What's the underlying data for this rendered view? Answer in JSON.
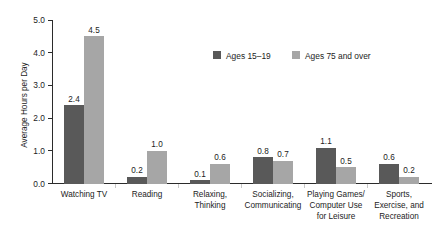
{
  "chart_data": {
    "type": "bar",
    "title": "",
    "subtitle": "",
    "xlabel": "",
    "ylabel": "Average Hours per Day",
    "ylim": [
      0.0,
      5.0
    ],
    "ytick_labels": [
      "0.0",
      "1.0",
      "2.0",
      "3.0",
      "4.0",
      "5.0"
    ],
    "ytick_values": [
      0.0,
      1.0,
      2.0,
      3.0,
      4.0,
      5.0
    ],
    "grid": false,
    "legend_position": "top-center-right",
    "categories": [
      "Watching TV",
      "Reading",
      "Relaxing,\nThinking",
      "Socializing,\nCommunicating",
      "Playing Games/\nComputer Use\nfor Leisure",
      "Sports,\nExercise, and\nRecreation"
    ],
    "category_lines": [
      [
        "Watching TV"
      ],
      [
        "Reading"
      ],
      [
        "Relaxing,",
        "Thinking"
      ],
      [
        "Socializing,",
        "Communicating"
      ],
      [
        "Playing Games/",
        "Computer Use",
        "for Leisure"
      ],
      [
        "Sports,",
        "Exercise, and",
        "Recreation"
      ]
    ],
    "series": [
      {
        "name": "Ages 15–19",
        "color": "#595959",
        "values": [
          2.4,
          0.2,
          0.1,
          0.8,
          1.1,
          0.6
        ],
        "value_labels": [
          "2.4",
          "0.2",
          "0.1",
          "0.8",
          "1.1",
          "0.6"
        ]
      },
      {
        "name": "Ages 75 and over",
        "color": "#a6a6a6",
        "values": [
          4.5,
          1.0,
          0.6,
          0.7,
          0.5,
          0.2
        ],
        "value_labels": [
          "4.5",
          "1.0",
          "0.6",
          "0.7",
          "0.5",
          "0.2"
        ]
      }
    ]
  },
  "legend": {
    "items": [
      {
        "label": "Ages 15–19",
        "color": "#595959"
      },
      {
        "label": "Ages 75 and over",
        "color": "#a6a6a6"
      }
    ]
  },
  "colors": {
    "series_dark": "#595959",
    "series_light": "#a6a6a6",
    "axis": "#2b2b2b",
    "text": "#1c1c1c",
    "background": "#ffffff",
    "separator": "#c9c9c9"
  }
}
